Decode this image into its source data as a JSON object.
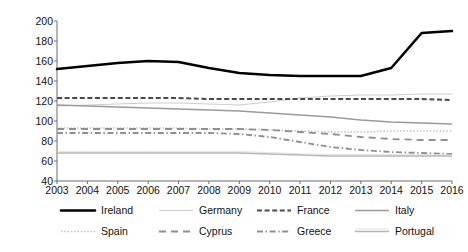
{
  "chart_data": {
    "type": "line",
    "title": "",
    "xlabel": "",
    "ylabel": "Index EU=100",
    "xlim": [
      2003,
      2016
    ],
    "ylim": [
      40,
      200
    ],
    "yticks": [
      40,
      60,
      80,
      100,
      120,
      140,
      160,
      180,
      200
    ],
    "grid": false,
    "legend_position": "below",
    "x": [
      2003,
      2004,
      2005,
      2006,
      2007,
      2008,
      2009,
      2010,
      2011,
      2012,
      2013,
      2014,
      2015,
      2016
    ],
    "categories": [
      "2003",
      "2004",
      "2005",
      "2006",
      "2007",
      "2008",
      "2009",
      "2010",
      "2011",
      "2012",
      "2013",
      "2014",
      "2015",
      "2016"
    ],
    "series": [
      {
        "name": "Ireland",
        "style": "solid-thick-black",
        "color": "#000000",
        "values": [
          152,
          155,
          158,
          160,
          159,
          153,
          148,
          146,
          145,
          145,
          145,
          153,
          188,
          190
        ]
      },
      {
        "name": "Germany",
        "style": "solid-thin-light",
        "color": "#cccccc",
        "values": [
          115,
          116,
          117,
          118,
          118,
          117,
          116,
          119,
          123,
          125,
          126,
          126,
          127,
          127
        ]
      },
      {
        "name": "France",
        "style": "dashed-dark",
        "color": "#4a4a4a",
        "values": [
          123,
          123,
          123,
          123,
          123,
          122,
          122,
          122,
          122,
          122,
          122,
          122,
          122,
          121
        ]
      },
      {
        "name": "Italy",
        "style": "solid-medium-gray",
        "color": "#9a9a9a",
        "values": [
          116,
          115,
          114,
          113,
          112,
          111,
          110,
          108,
          106,
          104,
          101,
          99,
          98,
          97
        ]
      },
      {
        "name": "Spain",
        "style": "dotted-light",
        "color": "#bdbdbd",
        "values": [
          93,
          93,
          93,
          93,
          93,
          92,
          92,
          91,
          90,
          89,
          89,
          90,
          90,
          90
        ]
      },
      {
        "name": "Cyprus",
        "style": "longdash-gray",
        "color": "#8f8f8f",
        "values": [
          92,
          92,
          92,
          92,
          92,
          92,
          92,
          91,
          89,
          87,
          84,
          82,
          81,
          81
        ]
      },
      {
        "name": "Greece",
        "style": "dashdot-gray",
        "color": "#8f8f8f",
        "values": [
          88,
          88,
          88,
          88,
          88,
          88,
          87,
          84,
          79,
          74,
          71,
          69,
          68,
          67
        ]
      },
      {
        "name": "Portugal",
        "style": "solid-light-double",
        "color": "#b5b5b5",
        "values": [
          68,
          68,
          68,
          68,
          68,
          68,
          68,
          67,
          66,
          65,
          65,
          65,
          65,
          65
        ]
      }
    ]
  },
  "axis": {
    "y_title": "Index EU=100",
    "y_ticks": [
      "200",
      "180",
      "160",
      "140",
      "120",
      "100",
      "80",
      "60",
      "40"
    ],
    "x_ticks": [
      "2003",
      "2004",
      "2005",
      "2006",
      "2007",
      "2008",
      "2009",
      "2010",
      "2011",
      "2012",
      "2013",
      "2014",
      "2015",
      "2016"
    ]
  },
  "legend": {
    "row1": [
      {
        "label": "Ireland"
      },
      {
        "label": "Germany"
      },
      {
        "label": "France"
      },
      {
        "label": "Italy"
      }
    ],
    "row2": [
      {
        "label": "Spain"
      },
      {
        "label": "Cyprus"
      },
      {
        "label": "Greece"
      },
      {
        "label": "Portugal"
      }
    ]
  }
}
